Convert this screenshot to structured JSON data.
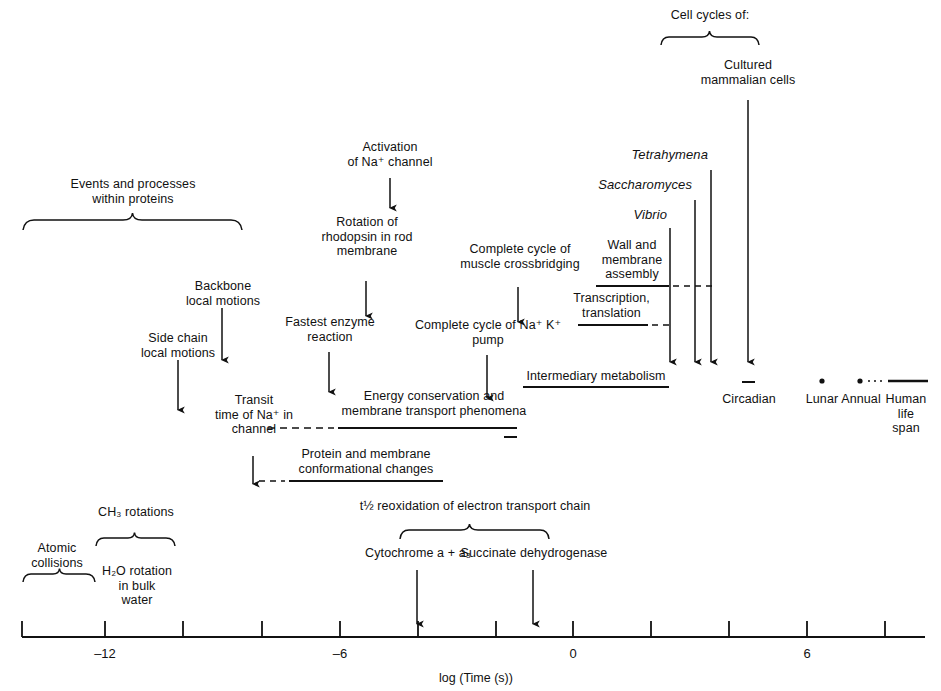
{
  "figure": {
    "title_axis": "log (Time (s))",
    "axis": {
      "label": "log (Time (s))",
      "ticks": [
        {
          "value": -14,
          "label": ""
        },
        {
          "value": -12,
          "label": "–12"
        },
        {
          "value": -10,
          "label": ""
        },
        {
          "value": -8,
          "label": ""
        },
        {
          "value": -6,
          "label": "–6"
        },
        {
          "value": -4,
          "label": ""
        },
        {
          "value": -2,
          "label": ""
        },
        {
          "value": 0,
          "label": "0"
        },
        {
          "value": 2,
          "label": ""
        },
        {
          "value": 4,
          "label": ""
        },
        {
          "value": 6,
          "label": "6"
        },
        {
          "value": 8,
          "label": ""
        }
      ],
      "range": [
        -14.6,
        8.6
      ]
    },
    "braces": [
      {
        "name": "events-within-proteins",
        "label_line1": "Events and processes",
        "label_line2": "within proteins"
      },
      {
        "name": "cell-cycles",
        "label_line1": "Cell cycles of:",
        "label_line2": ""
      },
      {
        "name": "atomic-collisions",
        "label_line1": "Atomic",
        "label_line2": "collisions"
      },
      {
        "name": "ch3-rotations",
        "label_line1": "CH₃ rotations",
        "label_line2": ""
      },
      {
        "name": "electron-transport",
        "label_line1": "t½ reoxidation of electron transport chain",
        "label_line2": ""
      }
    ],
    "labels": {
      "events_and_processes": "Events and processes\nwithin proteins",
      "cell_cycles_of": "Cell cycles of:",
      "cultured_mammalian_cells": "Cultured\nmammalian cells",
      "tetrahymena": "Tetrahymena",
      "saccharomyces": "Saccharomyces",
      "vibrio": "Vibrio",
      "wall_and_membrane_assembly": "Wall and\nmembrane\nassembly",
      "transcription_translation": "Transcription,\ntranslation",
      "intermediary_metabolism": "Intermediary metabolism",
      "circadian": "Circadian",
      "lunar": "Lunar",
      "annual": "Annual",
      "human_life_span": "Human\nlife\nspan",
      "activation_na_channel": "Activation\nof Na⁺ channel",
      "rotation_rhodopsin": "Rotation of\nrhodopsin in rod\nmembrane",
      "complete_cycle_muscle": "Complete cycle of\nmuscle crossbridging",
      "backbone_local_motions": "Backbone\nlocal motions",
      "side_chain_local_motions": "Side chain\nlocal motions",
      "fastest_enzyme_reaction": "Fastest enzyme\nreaction",
      "complete_cycle_nak_pump": "Complete cycle of Na⁺ K⁺\npump",
      "transit_time_na": "Transit\ntime of Na⁺ in\nchannel",
      "energy_conservation": "Energy conservation and\nmembrane transport phenomena",
      "protein_membrane_conformational": "Protein and membrane\nconformational changes",
      "t_half_reoxidation": "t½ reoxidation of electron transport chain",
      "cytochrome": "Cytochrome a + a₃",
      "succinate_dehydrogenase": "Succinate dehydrogenase",
      "atomic_collisions": "Atomic\ncollisions",
      "ch3_rotations": "CH₃ rotations",
      "h2o_rotation": "H₂O rotation\nin bulk\nwater"
    },
    "colors": {
      "ink": "#111111",
      "background": "#ffffff"
    }
  }
}
